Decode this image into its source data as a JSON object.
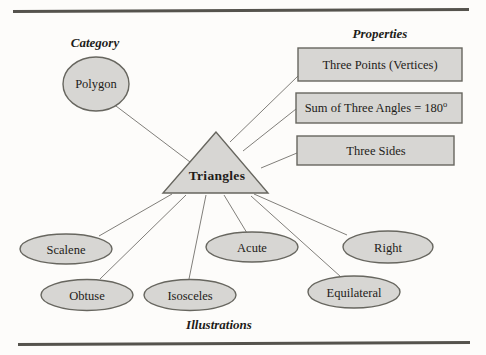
{
  "diagram": {
    "category_section": {
      "title": "Category",
      "node_label": "Polygon"
    },
    "center_node": "Triangles",
    "properties_section": {
      "title": "Properties",
      "items": [
        {
          "label": "Three Points (Vertices)"
        },
        {
          "label": "Sum of Three Angles = 180",
          "sup": "o"
        },
        {
          "label": "Three Sides"
        }
      ]
    },
    "illustrations_section": {
      "title": "Illustrations",
      "items": [
        "Scalene",
        "Obtuse",
        "Isosceles",
        "Acute",
        "Equilateral",
        "Right"
      ]
    },
    "colors": {
      "shape_fill": "#d7d6d3",
      "shape_border": "#67665f",
      "connector": "#817f7a",
      "text": "#1e1c19",
      "rule": "#55534d",
      "background": "#fdfcfa"
    }
  }
}
